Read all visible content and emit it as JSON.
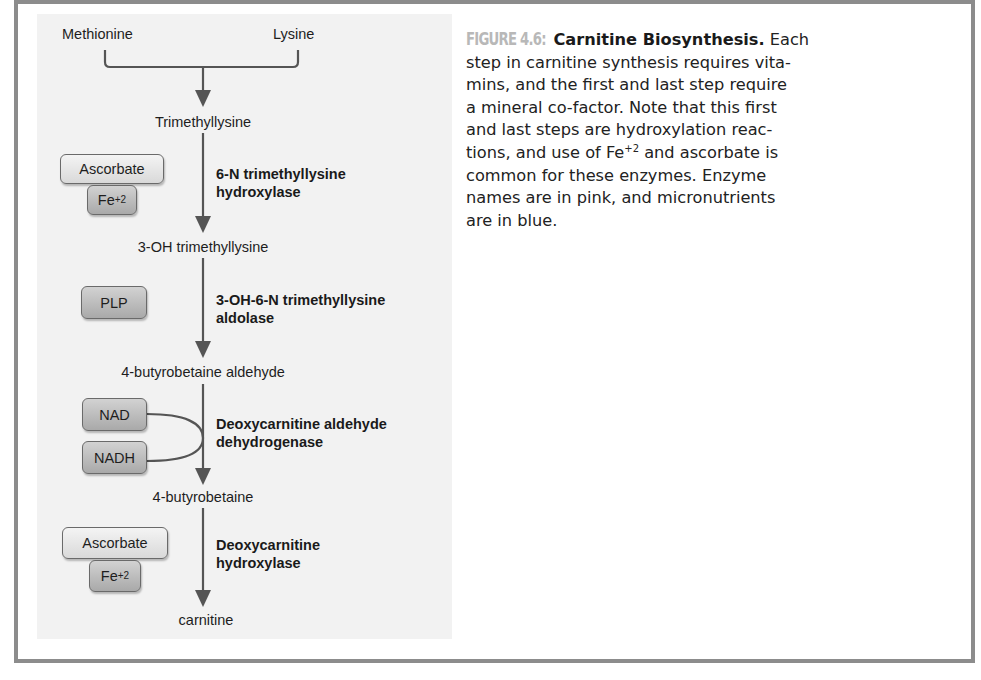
{
  "figure": {
    "label": "FIGURE 4.6:",
    "title": "Carnitine Biosynthesis.",
    "caption_lines": [
      " Each",
      "step in carnitine synthesis requires vita-",
      "mins, and the first and last step require",
      "a mineral co-factor. Note that this first",
      "and last steps are hydroxylation reac-",
      "tions, and use of Fe",
      "+2",
      " and ascorbate is",
      "common for these enzymes. Enzyme",
      "names are in pink, and micronutrients",
      "are in blue."
    ]
  },
  "pathway": {
    "precursors": [
      "Methionine",
      "Lysine"
    ],
    "metabolites": [
      "Trimethyllysine",
      "3-OH trimethyllysine",
      "4-butyrobetaine aldehyde",
      "4-butyrobetaine",
      "carnitine"
    ],
    "steps": [
      {
        "enzyme_line1": "6-N trimethyllysine",
        "enzyme_line2": "hydroxylase",
        "cofactors": [
          "Ascorbate",
          "Fe",
          "+2"
        ]
      },
      {
        "enzyme_line1": "3-OH-6-N trimethyllysine",
        "enzyme_line2": "aldolase",
        "cofactors": [
          "PLP"
        ]
      },
      {
        "enzyme_line1": "Deoxycarnitine aldehyde",
        "enzyme_line2": "dehydrogenase",
        "cofactors": [
          "NAD",
          "NADH"
        ]
      },
      {
        "enzyme_line1": "Deoxycarnitine",
        "enzyme_line2": "hydroxylase",
        "cofactors": [
          "Ascorbate",
          "Fe",
          "+2"
        ]
      }
    ]
  },
  "colors": {
    "frame_border": "#8c8c8c",
    "diagram_background": "#f2f2f2",
    "arrow": "#555555",
    "figure_label": "#b8b8b8",
    "cofactor_light": "#e6e6e6",
    "cofactor_dark": "#bdbdbd"
  }
}
